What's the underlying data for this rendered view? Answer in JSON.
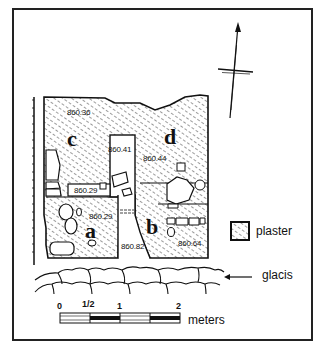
{
  "diagram": {
    "type": "archaeological site plan",
    "rooms": [
      {
        "label": "c"
      },
      {
        "label": "d"
      },
      {
        "label": "a"
      },
      {
        "label": "b"
      }
    ],
    "elevations": [
      "860.36",
      "860.41",
      "860.44",
      "860.29",
      "860.29",
      "860.82",
      "860.64"
    ],
    "legend": {
      "plaster_label": "plaster",
      "glacis_label": "glacis"
    },
    "scale_bar": {
      "ticks": [
        "0",
        "1/2",
        "1",
        "2"
      ],
      "unit": "meters"
    },
    "north_arrow": "north-arrow"
  },
  "colors": {
    "ink": "#111111",
    "background": "#ffffff"
  }
}
